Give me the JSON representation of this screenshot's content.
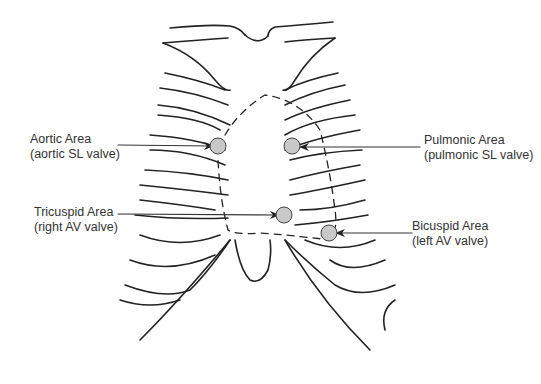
{
  "diagram": {
    "type": "anatomical-illustration",
    "marker_color": "#c8c8c8",
    "line_color": "#222222",
    "labels": [
      {
        "id": "aortic",
        "title": "Aortic Area",
        "subtitle": "(aortic SL valve)",
        "side": "left"
      },
      {
        "id": "pulmonic",
        "title": "Pulmonic Area",
        "subtitle": "(pulmonic SL valve)",
        "side": "right"
      },
      {
        "id": "tricuspid",
        "title": "Tricuspid Area",
        "subtitle": "(right AV valve)",
        "side": "left"
      },
      {
        "id": "bicuspid",
        "title": "Bicuspid Area",
        "subtitle": "(left AV valve)",
        "side": "right"
      }
    ]
  }
}
